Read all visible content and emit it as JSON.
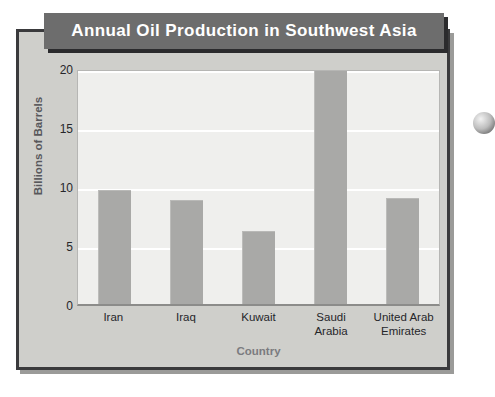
{
  "chart_data": {
    "type": "bar",
    "title": "Annual Oil Production in Southwest Asia",
    "xlabel": "Country",
    "ylabel": "Billions of Barrels",
    "categories": [
      "Iran",
      "Iraq",
      "Kuwait",
      "Saudi Arabia",
      "United Arab Emirates"
    ],
    "category_lines": [
      [
        "Iran"
      ],
      [
        "Iraq"
      ],
      [
        "Kuwait"
      ],
      [
        "Saudi",
        "Arabia"
      ],
      [
        "United Arab",
        "Emirates"
      ]
    ],
    "values": [
      9.6,
      8.7,
      6.1,
      19.8,
      8.9
    ],
    "ylim": [
      0,
      20
    ],
    "yticks": [
      0,
      5,
      10,
      15,
      20
    ],
    "ytick_labels": [
      "0",
      "5",
      "10",
      "15",
      "20"
    ],
    "grid": true,
    "grid_axis": "y",
    "legend": false,
    "bar_color": "#a9a9a7",
    "plot_background": "#efefed",
    "gridline_color": "#ffffff"
  },
  "figure": {
    "card_background": "#cfcfcb",
    "card_border_color": "#3a3a3c",
    "title_banner_color": "#6d6d6d",
    "title_text_color": "#ffffff",
    "axis_label_color": "#7b7b7f"
  },
  "marker": {
    "name": "page-bullet-marker"
  }
}
